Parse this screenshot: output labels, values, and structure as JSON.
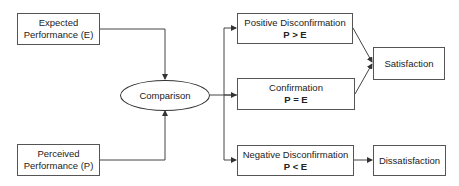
{
  "diagram": {
    "type": "flowchart",
    "nodes": {
      "expected": {
        "line1": "Expected",
        "line2": "Performance (E)"
      },
      "perceived": {
        "line1": "Perceived",
        "line2": "Performance (P)"
      },
      "comparison": {
        "label": "Comparison"
      },
      "positive": {
        "label": "Positive Disconfirmation",
        "formula": "P > E"
      },
      "confirmation": {
        "label": "Confirmation",
        "formula": "P = E"
      },
      "negative": {
        "label": "Negative Disconfirmation",
        "formula": "P < E"
      },
      "satisfaction": {
        "label": "Satisfaction"
      },
      "dissatisfaction": {
        "label": "Dissatisfaction"
      }
    },
    "edges": [
      {
        "from": "Expected Performance (E)",
        "to": "Comparison"
      },
      {
        "from": "Perceived Performance (P)",
        "to": "Comparison"
      },
      {
        "from": "Comparison",
        "to": "Positive Disconfirmation"
      },
      {
        "from": "Comparison",
        "to": "Confirmation"
      },
      {
        "from": "Comparison",
        "to": "Negative Disconfirmation"
      },
      {
        "from": "Positive Disconfirmation",
        "to": "Satisfaction"
      },
      {
        "from": "Confirmation",
        "to": "Satisfaction"
      },
      {
        "from": "Negative Disconfirmation",
        "to": "Dissatisfaction"
      }
    ],
    "colors": {
      "line": "#444444",
      "border": "#555555",
      "text": "#222222"
    }
  }
}
